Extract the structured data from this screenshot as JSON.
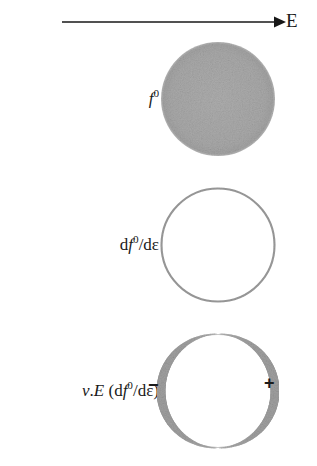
{
  "figure": {
    "kind": "physics-diagram",
    "background_color": "#ffffff",
    "ink_color": "#1a1a1a",
    "shade_color": "#a9a9a9",
    "ring_color": "#9a9a9a"
  },
  "field_arrow": {
    "label": "E",
    "direction": "right",
    "arrow_icon_name": "right-arrow-icon"
  },
  "rows": [
    {
      "id": "f0",
      "label_html_parts": {
        "italic": "f",
        "superscript": "0"
      },
      "label_plain": "f0",
      "shape": "filled-disk",
      "fill": "#a9a9a9",
      "ring_width": 0,
      "signs": []
    },
    {
      "id": "dfde",
      "label_plain": "df0/dε",
      "shape": "thin-ring",
      "fill": "none",
      "ring_width": 2,
      "ring_color": "#9a9a9a",
      "signs": []
    },
    {
      "id": "vedfde",
      "label_plain": "v.E (df0/dε)",
      "shape": "cosine-modulated-ring",
      "fill": "none",
      "ring_width_max": 9,
      "ring_width_min": 1,
      "ring_color": "#a0a0a0",
      "signs": [
        {
          "name": "minus",
          "glyph": "−",
          "side": "left"
        },
        {
          "name": "plus",
          "glyph": "+",
          "side": "right"
        }
      ]
    }
  ],
  "circle_geometry": {
    "center_x": 61,
    "center_y": 63,
    "radius": 57
  }
}
